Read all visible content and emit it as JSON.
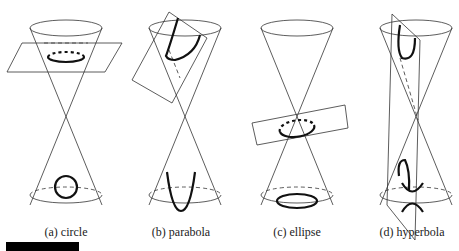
{
  "figure": {
    "panels": [
      {
        "id": "a",
        "label": "(a) circle",
        "curve": "circle",
        "cx": 66
      },
      {
        "id": "b",
        "label": "(b) parabola",
        "curve": "parabola",
        "cx": 181
      },
      {
        "id": "c",
        "label": "(c) ellipse",
        "curve": "ellipse",
        "cx": 297
      },
      {
        "id": "d",
        "label": "(d) hyperbola",
        "curve": "hyperbola",
        "cx": 412
      }
    ]
  },
  "colors": {
    "line": "#333333",
    "curve": "#111111",
    "background": "#ffffff"
  }
}
